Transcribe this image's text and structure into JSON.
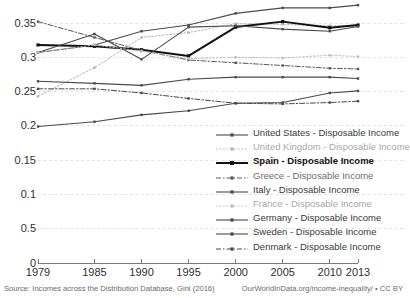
{
  "chart_data": {
    "type": "line",
    "title": "",
    "subtitle": "",
    "xlabel": "",
    "ylabel": "",
    "grid": true,
    "legend_position": "inside-bottom-right",
    "x": [
      1979,
      1985,
      1990,
      1995,
      2000,
      2005,
      2010,
      2013
    ],
    "xlim": [
      1979,
      2013
    ],
    "ylim": [
      0,
      0.375
    ],
    "x_tick_labels": [
      "1979",
      "1985",
      "1990",
      "1995",
      "2000",
      "2005",
      "2010",
      "2013"
    ],
    "y_tick_labels": [
      "0.35",
      "0.3",
      "0.25",
      "0.2",
      "0.15",
      "0.1",
      "0.5",
      "0"
    ],
    "y_tick_values": [
      0.35,
      0.3,
      0.25,
      0.2,
      0.15,
      0.1,
      0.05,
      0
    ],
    "series": [
      {
        "name": "United States - Disposable Income",
        "legend_label": "United States - Disposable Income",
        "style": "solid",
        "color": "#4a4a4a",
        "width": 1.1,
        "points": [
          {
            "x": 1979,
            "y": 0.307
          },
          {
            "x": 1985,
            "y": 0.318
          },
          {
            "x": 1990,
            "y": 0.338
          },
          {
            "x": 1995,
            "y": 0.347
          },
          {
            "x": 2000,
            "y": 0.364
          },
          {
            "x": 2005,
            "y": 0.372
          },
          {
            "x": 2010,
            "y": 0.372
          },
          {
            "x": 2013,
            "y": 0.376
          }
        ]
      },
      {
        "name": "United Kingdom - Disposable Income",
        "legend_label": "United Kingdom - Disposable Income",
        "style": "dotted",
        "color": "#b4b4b4",
        "width": 1.0,
        "points": [
          {
            "x": 1979,
            "y": 0.243
          },
          {
            "x": 1985,
            "y": 0.285
          },
          {
            "x": 1990,
            "y": 0.329
          },
          {
            "x": 1995,
            "y": 0.336
          },
          {
            "x": 2000,
            "y": 0.349
          },
          {
            "x": 2005,
            "y": 0.348
          },
          {
            "x": 2010,
            "y": 0.346
          },
          {
            "x": 2013,
            "y": 0.345
          }
        ]
      },
      {
        "name": "Spain - Disposable Income",
        "legend_label": "Spain - Disposable Income",
        "style": "solid",
        "color": "#111111",
        "width": 2.0,
        "points": [
          {
            "x": 1979,
            "y": 0.318
          },
          {
            "x": 1985,
            "y": 0.316
          },
          {
            "x": 1990,
            "y": 0.311
          },
          {
            "x": 1995,
            "y": 0.302
          },
          {
            "x": 2000,
            "y": 0.344
          },
          {
            "x": 2005,
            "y": 0.352
          },
          {
            "x": 2010,
            "y": 0.343
          },
          {
            "x": 2013,
            "y": 0.347
          }
        ]
      },
      {
        "name": "Greece - Disposable Income",
        "legend_label": "Greece - Disposable Income",
        "style": "dashdot",
        "color": "#5a5a5a",
        "width": 1.0,
        "points": [
          {
            "x": 1979,
            "y": 0.352
          },
          {
            "x": 1985,
            "y": 0.329
          },
          {
            "x": 1990,
            "y": 0.31
          },
          {
            "x": 1995,
            "y": 0.296
          },
          {
            "x": 2000,
            "y": 0.292
          },
          {
            "x": 2005,
            "y": 0.288
          },
          {
            "x": 2010,
            "y": 0.284
          },
          {
            "x": 2013,
            "y": 0.283
          }
        ]
      },
      {
        "name": "Italy - Disposable Income",
        "legend_label": "Italy - Disposable Income",
        "style": "solid",
        "color": "#4a4a4a",
        "width": 1.1,
        "points": [
          {
            "x": 1979,
            "y": 0.307
          },
          {
            "x": 1985,
            "y": 0.334
          },
          {
            "x": 1990,
            "y": 0.297
          },
          {
            "x": 1995,
            "y": 0.344
          },
          {
            "x": 2000,
            "y": 0.346
          },
          {
            "x": 2005,
            "y": 0.341
          },
          {
            "x": 2010,
            "y": 0.338
          },
          {
            "x": 2013,
            "y": 0.345
          }
        ]
      },
      {
        "name": "France - Disposable Income",
        "legend_label": "France - Disposable Income",
        "style": "dotted",
        "color": "#bdbdbd",
        "width": 1.0,
        "points": [
          {
            "x": 1979,
            "y": 0.307
          },
          {
            "x": 1985,
            "y": 0.318
          },
          {
            "x": 1990,
            "y": 0.309
          },
          {
            "x": 1995,
            "y": 0.298
          },
          {
            "x": 2000,
            "y": 0.3
          },
          {
            "x": 2005,
            "y": 0.299
          },
          {
            "x": 2010,
            "y": 0.303
          },
          {
            "x": 2013,
            "y": 0.301
          }
        ]
      },
      {
        "name": "Germany - Disposable Income",
        "legend_label": "Germany - Disposable Income",
        "style": "solid",
        "color": "#4a4a4a",
        "width": 1.1,
        "points": [
          {
            "x": 1979,
            "y": 0.265
          },
          {
            "x": 1985,
            "y": 0.262
          },
          {
            "x": 1990,
            "y": 0.259
          },
          {
            "x": 1995,
            "y": 0.268
          },
          {
            "x": 2000,
            "y": 0.271
          },
          {
            "x": 2005,
            "y": 0.271
          },
          {
            "x": 2010,
            "y": 0.271
          },
          {
            "x": 2013,
            "y": 0.269
          }
        ]
      },
      {
        "name": "Sweden - Disposable Income",
        "legend_label": "Sweden - Disposable Income",
        "style": "solid",
        "color": "#4a4a4a",
        "width": 1.1,
        "points": [
          {
            "x": 1979,
            "y": 0.199
          },
          {
            "x": 1985,
            "y": 0.206
          },
          {
            "x": 1990,
            "y": 0.216
          },
          {
            "x": 1995,
            "y": 0.222
          },
          {
            "x": 2000,
            "y": 0.233
          },
          {
            "x": 2005,
            "y": 0.234
          },
          {
            "x": 2010,
            "y": 0.248
          },
          {
            "x": 2013,
            "y": 0.251
          }
        ]
      },
      {
        "name": "Denmark - Disposable Income",
        "legend_label": "Denmark - Disposable Income",
        "style": "dashdot",
        "color": "#4a4a4a",
        "width": 1.0,
        "points": [
          {
            "x": 1979,
            "y": 0.254
          },
          {
            "x": 1985,
            "y": 0.254
          },
          {
            "x": 1990,
            "y": 0.248
          },
          {
            "x": 1995,
            "y": 0.24
          },
          {
            "x": 2000,
            "y": 0.233
          },
          {
            "x": 2005,
            "y": 0.232
          },
          {
            "x": 2010,
            "y": 0.234
          },
          {
            "x": 2013,
            "y": 0.236
          }
        ]
      }
    ]
  },
  "footer": {
    "source": "Source: Incomes across the Distribution Database, Gini (2016)",
    "attribution": "OurWorldInData.org/income-inequality/ • CC BY"
  },
  "colors": {
    "grid": "#f0dede",
    "axis": "#7a7a7a",
    "text": "#2f2f2f",
    "footer_text": "#6a6a6a"
  }
}
